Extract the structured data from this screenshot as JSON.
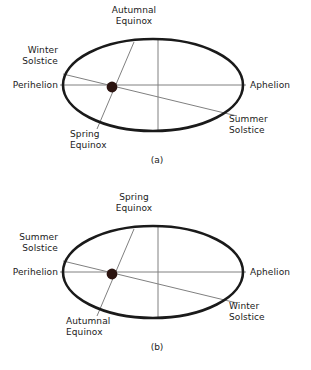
{
  "document": {
    "title": "Earth Orbit: Equinox and Solstice Positions",
    "background_color": "#ffffff",
    "text_color": "#1a1a1a",
    "orbit_stroke_color": "#1a1a1a",
    "axis_line_color": "#808080",
    "sun_color": "#2b1410"
  },
  "figures": [
    {
      "id": "figure-a",
      "caption": "(a)",
      "labels": {
        "top": "Autumnal\nEquinox",
        "upper_left": "Winter\nSolstice",
        "left": "Perihelion",
        "right": "Aphelion",
        "lower_right": "Summer\nSolstice",
        "bottom_left": "Spring\nEquinox"
      }
    },
    {
      "id": "figure-b",
      "caption": "(b)",
      "labels": {
        "top": "Spring\nEquinox",
        "upper_left": "Summer\nSolstice",
        "left": "Perihelion",
        "right": "Aphelion",
        "lower_right": "Winter\nSolstice",
        "bottom_left": "Autumnal\nEquinox"
      }
    }
  ]
}
